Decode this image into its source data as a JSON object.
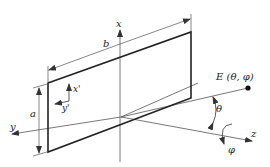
{
  "diagram": {
    "type": "rectangular aperture antenna coordinate system",
    "labels": {
      "x_axis": "x",
      "y_axis": "y",
      "z_axis": "z",
      "local_x": "x'",
      "local_y": "y'",
      "width_dim": "b",
      "height_dim": "a",
      "field_point": "E (θ, φ)",
      "theta": "θ",
      "phi": "φ"
    },
    "colors": {
      "thick_line": "#222222",
      "thin_line": "#555555",
      "background": "#ffffff"
    }
  }
}
